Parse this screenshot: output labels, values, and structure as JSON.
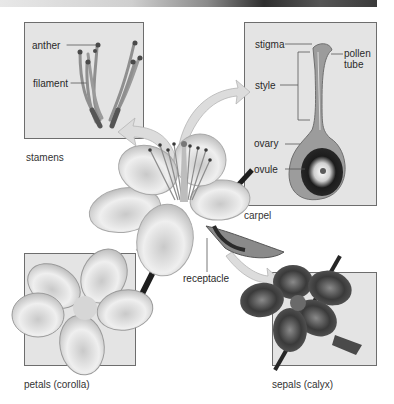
{
  "diagram": {
    "panels": {
      "stamens": {
        "caption": "stamens",
        "labels": {
          "anther": "anther",
          "filament": "filament"
        }
      },
      "carpel": {
        "caption": "carpel",
        "labels": {
          "stigma": "stigma",
          "pollen_tube_line1": "pollen",
          "pollen_tube_line2": "tube",
          "style": "style",
          "ovary": "ovary",
          "ovule": "ovule"
        }
      },
      "petals": {
        "caption": "petals (corolla)"
      },
      "sepals": {
        "caption": "sepals (calyx)"
      }
    },
    "center": {
      "receptacle_label": "receptacle"
    },
    "colors": {
      "panel_bg": "#e4e4e4",
      "panel_border": "#6d6d6d",
      "arrow": "#d8d8d8",
      "stem": "#1e1e1e",
      "petal_light": "#f2f2f2",
      "sepal_dark": "#3d3d3d"
    }
  }
}
